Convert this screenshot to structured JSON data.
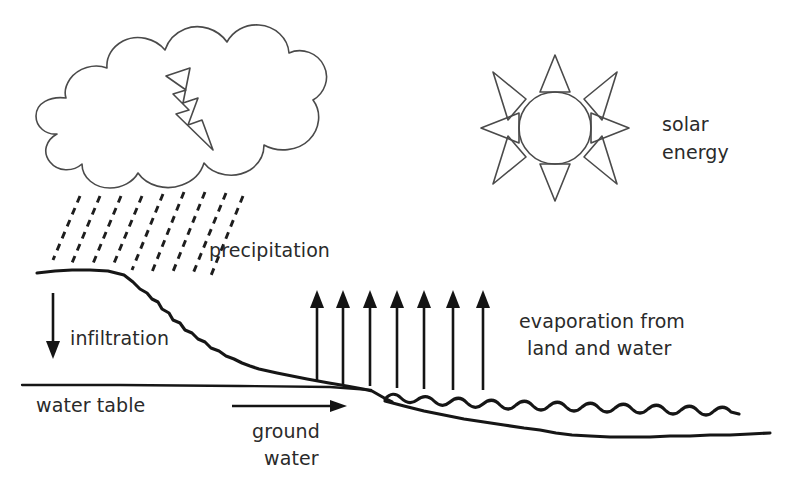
{
  "diagram": {
    "background_color": "#ffffff",
    "ink_color": "#1b1b1b",
    "outline_color": "#4a4a4a"
  },
  "labels": {
    "precipitation": "precipitation",
    "solar_energy_line1": "solar",
    "solar_energy_line2": "energy",
    "infiltration": "infiltration",
    "water_table": "water table",
    "ground_water_line1": "ground",
    "ground_water_line2": "water",
    "evaporation_line1": "evaporation from",
    "evaporation_line2": "land and water"
  },
  "elements": {
    "cloud": "cloud-outline",
    "lightning": "lightning-bolt-icon",
    "rain": "rain-dashes",
    "sun": "sun-icon",
    "sun_rays_count": 8,
    "infiltration_arrow": "down-arrow-icon",
    "ground_water_arrow": "right-arrow-icon",
    "evaporation_arrows_count": 7,
    "terrain": "land-slope-line",
    "water_table_line": "water-table-line",
    "water_surface": "wave-surface-line",
    "lake_bed": "lake-bed-line"
  }
}
